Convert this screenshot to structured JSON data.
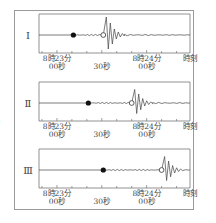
{
  "edge_glyph": ")",
  "axis": {
    "label_end": "時刻",
    "ticks": [
      {
        "line1": "8時23分",
        "line2": "00秒",
        "t": 0
      },
      {
        "line1": "",
        "line2": "30秒",
        "t": 30
      },
      {
        "line1": "8時24分",
        "line2": "00秒",
        "t": 60
      }
    ],
    "range_seconds": [
      -12,
      89
    ],
    "minor_tick_step_seconds": 10
  },
  "panels": [
    {
      "id": "I",
      "label": "Ⅰ",
      "p_arrival_s": 11,
      "s_arrival_s": 31
    },
    {
      "id": "II",
      "label": "Ⅱ",
      "p_arrival_s": 21,
      "s_arrival_s": 50
    },
    {
      "id": "III",
      "label": "Ⅲ",
      "p_arrival_s": 31,
      "s_arrival_s": 70
    }
  ],
  "legend_marks": {
    "filled_dot": "P-wave arrival (small shaking start)",
    "open_circle": "S-wave arrival (large shaking start)"
  }
}
